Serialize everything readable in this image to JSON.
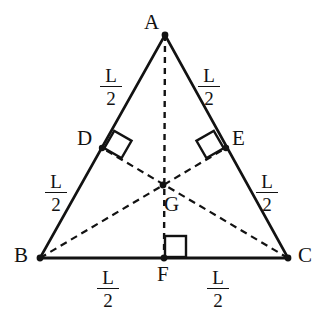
{
  "figure": {
    "type": "geometry-diagram",
    "background_color": "#ffffff",
    "stroke_color": "#121212",
    "canvas": {
      "width": 325,
      "height": 321
    }
  },
  "vertices": [
    {
      "id": "A",
      "label": "A",
      "x": 165,
      "y": 35,
      "label_x": 144,
      "label_y": 12
    },
    {
      "id": "B",
      "label": "B",
      "x": 40,
      "y": 258,
      "label_x": 14,
      "label_y": 245
    },
    {
      "id": "C",
      "label": "C",
      "x": 288,
      "y": 258,
      "label_x": 298,
      "label_y": 245
    },
    {
      "id": "D",
      "label": "D",
      "x": 102,
      "y": 148,
      "label_x": 77,
      "label_y": 128
    },
    {
      "id": "E",
      "label": "E",
      "x": 226,
      "y": 148,
      "label_x": 232,
      "label_y": 128
    },
    {
      "id": "F",
      "label": "F",
      "x": 164,
      "y": 258,
      "label_x": 157,
      "label_y": 264
    },
    {
      "id": "G",
      "label": "G",
      "x": 163,
      "y": 185,
      "label_x": 164,
      "label_y": 194
    }
  ],
  "solid_edges": [
    {
      "name": "side-ab",
      "from": "A",
      "to": "B"
    },
    {
      "name": "side-ac",
      "from": "A",
      "to": "C"
    },
    {
      "name": "side-bc",
      "from": "B",
      "to": "C"
    }
  ],
  "dashed_edges": [
    {
      "name": "median-a-f",
      "from": "A",
      "to": "F"
    },
    {
      "name": "median-b-e",
      "from": "B",
      "to": "E"
    },
    {
      "name": "median-c-d",
      "from": "C",
      "to": "D"
    }
  ],
  "right_angles": [
    {
      "name": "right-angle-at-d",
      "at": "D",
      "rotation_deg": -60
    },
    {
      "name": "right-angle-at-e",
      "at": "E",
      "rotation_deg": 60
    },
    {
      "name": "right-angle-at-f",
      "at": "F",
      "rotation_deg": 0
    }
  ],
  "length_labels": [
    {
      "name": "length-ad",
      "numerator": "L",
      "denominator": "2",
      "x": 98,
      "y": 66,
      "segment": "A-D"
    },
    {
      "name": "length-ae",
      "numerator": "L",
      "denominator": "2",
      "x": 196,
      "y": 66,
      "segment": "A-E"
    },
    {
      "name": "length-db",
      "numerator": "L",
      "denominator": "2",
      "x": 43,
      "y": 172,
      "segment": "D-B"
    },
    {
      "name": "length-ec",
      "numerator": "L",
      "denominator": "2",
      "x": 254,
      "y": 172,
      "segment": "E-C"
    },
    {
      "name": "length-bf",
      "numerator": "L",
      "denominator": "2",
      "x": 95,
      "y": 268,
      "segment": "B-F"
    },
    {
      "name": "length-fc",
      "numerator": "L",
      "denominator": "2",
      "x": 205,
      "y": 268,
      "segment": "F-C"
    }
  ]
}
